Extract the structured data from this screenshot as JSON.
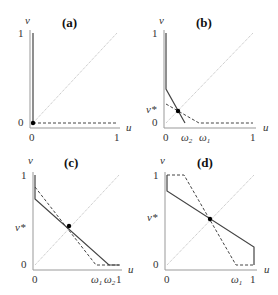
{
  "figure": {
    "panels": [
      {
        "id": "a",
        "title": "(a)",
        "x_axis_label": "u",
        "y_axis_label": "v",
        "x_ticks": [
          "0",
          "1"
        ],
        "y_ticks": [
          "0",
          "1"
        ]
      },
      {
        "id": "b",
        "title": "(b)",
        "x_axis_label": "u",
        "y_axis_label": "v",
        "x_ticks": [
          "0",
          "ω2",
          "ω1",
          "1"
        ],
        "y_ticks": [
          "0",
          "v*",
          "1"
        ]
      },
      {
        "id": "c",
        "title": "(c)",
        "x_axis_label": "u",
        "y_axis_label": "v",
        "x_ticks": [
          "0",
          "ω1",
          "ω2",
          "1"
        ],
        "y_ticks": [
          "0",
          "v*",
          "1"
        ]
      },
      {
        "id": "d",
        "title": "(d)",
        "x_axis_label": "u",
        "y_axis_label": "v",
        "x_ticks": [
          "0",
          "ω1",
          "1"
        ],
        "y_ticks": [
          "0",
          "v*",
          "1"
        ]
      }
    ],
    "legend_semantics": {
      "solid": "v-nullcline / best response curve",
      "dashed": "u-nullcline / best response curve",
      "dotted": "diagonal u = v",
      "dot": "equilibrium"
    },
    "colors": {
      "solid_line": "#444444",
      "dashed_line": "#444444",
      "diagonal": "#aaaaaa",
      "axis": "#999999",
      "equilibrium": "#000000"
    }
  },
  "chart_data": [
    {
      "type": "line",
      "title": "(a)",
      "xlabel": "u",
      "ylabel": "v",
      "xlim": [
        0,
        1
      ],
      "ylim": [
        0,
        1
      ],
      "series": [
        {
          "name": "solid",
          "style": "solid",
          "points": [
            [
              0,
              0
            ],
            [
              0,
              1
            ]
          ]
        },
        {
          "name": "dashed",
          "style": "dashed",
          "points": [
            [
              0,
              0
            ],
            [
              1,
              0
            ]
          ]
        },
        {
          "name": "diagonal",
          "style": "dotted",
          "points": [
            [
              0,
              0
            ],
            [
              1,
              1
            ]
          ]
        }
      ],
      "equilibrium": [
        0,
        0
      ]
    },
    {
      "type": "line",
      "title": "(b)",
      "xlabel": "u",
      "ylabel": "v",
      "xlim": [
        0,
        1
      ],
      "ylim": [
        0,
        1
      ],
      "series": [
        {
          "name": "solid",
          "style": "solid",
          "points": [
            [
              0,
              1
            ],
            [
              0,
              0.46
            ],
            [
              0.2,
              0
            ]
          ]
        },
        {
          "name": "dashed",
          "style": "dashed",
          "points": [
            [
              0,
              0.24
            ],
            [
              0.37,
              0
            ],
            [
              1,
              0
            ]
          ]
        },
        {
          "name": "diagonal",
          "style": "dotted",
          "points": [
            [
              0,
              0
            ],
            [
              1,
              1
            ]
          ]
        }
      ],
      "equilibrium": [
        0.14,
        0.14
      ],
      "annotations": {
        "v*": 0.14,
        "ω2": 0.2,
        "ω1": 0.37
      }
    },
    {
      "type": "line",
      "title": "(c)",
      "xlabel": "u",
      "ylabel": "v",
      "xlim": [
        0,
        1
      ],
      "ylim": [
        0,
        1
      ],
      "series": [
        {
          "name": "solid",
          "style": "solid",
          "points": [
            [
              0,
              1
            ],
            [
              0,
              0.73
            ],
            [
              0.86,
              0
            ],
            [
              1,
              0
            ]
          ]
        },
        {
          "name": "dashed",
          "style": "dashed",
          "points": [
            [
              0,
              0.87
            ],
            [
              0.72,
              0
            ],
            [
              1,
              0
            ]
          ]
        },
        {
          "name": "diagonal",
          "style": "dotted",
          "points": [
            [
              0,
              0
            ],
            [
              1,
              1
            ]
          ]
        }
      ],
      "equilibrium": [
        0.43,
        0.43
      ],
      "annotations": {
        "v*": 0.43,
        "ω1": 0.72,
        "ω2": 0.86
      }
    },
    {
      "type": "line",
      "title": "(d)",
      "xlabel": "u",
      "ylabel": "v",
      "xlim": [
        0,
        1
      ],
      "ylim": [
        0,
        1
      ],
      "series": [
        {
          "name": "solid",
          "style": "solid",
          "points": [
            [
              0,
              1
            ],
            [
              0,
              0.81
            ],
            [
              1,
              0.2
            ],
            [
              1,
              0
            ]
          ]
        },
        {
          "name": "dashed",
          "style": "dashed",
          "points": [
            [
              0,
              1
            ],
            [
              0.2,
              1
            ],
            [
              0.8,
              0
            ],
            [
              1,
              0
            ]
          ]
        },
        {
          "name": "diagonal",
          "style": "dotted",
          "points": [
            [
              0,
              0
            ],
            [
              1,
              1
            ]
          ]
        }
      ],
      "equilibrium": [
        0.5,
        0.5
      ],
      "annotations": {
        "v*": 0.5,
        "ω1": 0.8
      }
    }
  ]
}
